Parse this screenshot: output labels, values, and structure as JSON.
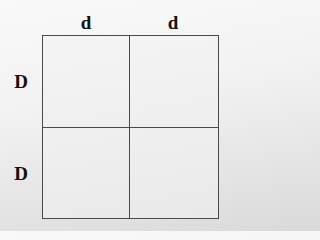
{
  "diagram": {
    "type": "punnett-square",
    "column_alleles": [
      "d",
      "d"
    ],
    "row_alleles": [
      "D",
      "D"
    ],
    "cells": [
      [
        "",
        ""
      ],
      [
        "",
        ""
      ]
    ]
  },
  "colors": {
    "grid_line": "#4a4a4a",
    "label_text": "#111111",
    "background_top": "#f9f9f9",
    "background_bottom": "#d9d9d9"
  }
}
